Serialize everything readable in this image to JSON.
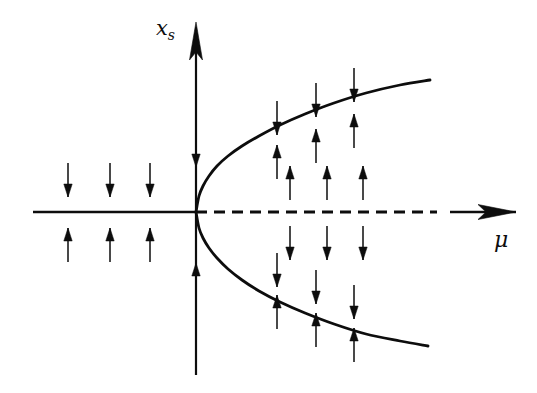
{
  "figure": {
    "kind": "pitchfork-bifurcation-diagram",
    "background_color": "#ffffff",
    "ink_color": "#0d0d0d",
    "width": 537,
    "height": 393,
    "vertical_axis_label": "x",
    "vertical_axis_label_subscript": "s",
    "horizontal_axis_label": "μ"
  },
  "chart_data": {
    "type": "line",
    "title": "",
    "xlabel": "μ",
    "ylabel": "x_s",
    "grid": false,
    "legend": "none",
    "xlim": [
      -1,
      1
    ],
    "ylim": [
      -1,
      1
    ],
    "origin_px": {
      "x": 196,
      "y": 212
    },
    "axes": {
      "horizontal": {
        "name": "mu-axis",
        "x_start_px": 33,
        "x_end_px": 516,
        "y_px": 212,
        "arrow_at": "right",
        "segments": [
          {
            "from_px": 33,
            "to_px": 196,
            "style": "solid",
            "meaning": "stable-branch-mu-negative"
          },
          {
            "from_px": 196,
            "to_px": 437,
            "style": "dashed",
            "meaning": "unstable-branch-mu-positive"
          },
          {
            "from_px": 450,
            "to_px": 516,
            "style": "solid",
            "meaning": "axis-arrow-tail"
          }
        ]
      },
      "vertical": {
        "name": "xs-axis",
        "x_px": 196,
        "y_start_px": 375,
        "y_end_px": 22,
        "arrow_at": "top"
      }
    },
    "branches": [
      {
        "name": "upper-stable-branch",
        "style": "solid",
        "points_px": [
          [
            196,
            212
          ],
          [
            199,
            196
          ],
          [
            203,
            186
          ],
          [
            209,
            176
          ],
          [
            217,
            166
          ],
          [
            228,
            156
          ],
          [
            242,
            146
          ],
          [
            259,
            136
          ],
          [
            280,
            125
          ],
          [
            305,
            114
          ],
          [
            334,
            103
          ],
          [
            366,
            93
          ],
          [
            400,
            85
          ],
          [
            430,
            80
          ]
        ]
      },
      {
        "name": "lower-stable-branch",
        "style": "solid",
        "points_px": [
          [
            196,
            212
          ],
          [
            199,
            228
          ],
          [
            203,
            238
          ],
          [
            209,
            248
          ],
          [
            217,
            258
          ],
          [
            228,
            269
          ],
          [
            242,
            280
          ],
          [
            259,
            291
          ],
          [
            280,
            302
          ],
          [
            305,
            313
          ],
          [
            334,
            324
          ],
          [
            366,
            334
          ],
          [
            400,
            341
          ],
          [
            428,
            346
          ]
        ]
      },
      {
        "name": "unstable-branch-dashed",
        "style": "dashed",
        "points_px": [
          [
            196,
            212
          ],
          [
            437,
            212
          ]
        ]
      },
      {
        "name": "stable-branch-left",
        "style": "solid",
        "points_px": [
          [
            33,
            212
          ],
          [
            196,
            212
          ]
        ]
      }
    ],
    "flow_arrows": [
      {
        "group": "left-above-axis",
        "x_px": 68,
        "y_px": 180,
        "direction": "down"
      },
      {
        "group": "left-above-axis",
        "x_px": 110,
        "y_px": 180,
        "direction": "down"
      },
      {
        "group": "left-above-axis",
        "x_px": 150,
        "y_px": 180,
        "direction": "down"
      },
      {
        "group": "left-below-axis",
        "x_px": 68,
        "y_px": 245,
        "direction": "up"
      },
      {
        "group": "left-below-axis",
        "x_px": 110,
        "y_px": 245,
        "direction": "up"
      },
      {
        "group": "left-below-axis",
        "x_px": 150,
        "y_px": 245,
        "direction": "up"
      },
      {
        "group": "axis-vertical",
        "x_px": 196,
        "y_px": 150,
        "direction": "down"
      },
      {
        "group": "axis-vertical",
        "x_px": 196,
        "y_px": 280,
        "direction": "up"
      },
      {
        "group": "right-above-dashed",
        "x_px": 290,
        "y_px": 183,
        "direction": "up"
      },
      {
        "group": "right-above-dashed",
        "x_px": 327,
        "y_px": 183,
        "direction": "up"
      },
      {
        "group": "right-above-dashed",
        "x_px": 363,
        "y_px": 183,
        "direction": "up"
      },
      {
        "group": "right-below-dashed",
        "x_px": 290,
        "y_px": 243,
        "direction": "down"
      },
      {
        "group": "right-below-dashed",
        "x_px": 327,
        "y_px": 243,
        "direction": "down"
      },
      {
        "group": "right-below-dashed",
        "x_px": 363,
        "y_px": 243,
        "direction": "down"
      },
      {
        "group": "above-upper-branch",
        "x_px": 277,
        "y_px": 118,
        "direction": "down"
      },
      {
        "group": "above-upper-branch",
        "x_px": 316,
        "y_px": 100,
        "direction": "down"
      },
      {
        "group": "above-upper-branch",
        "x_px": 354,
        "y_px": 85,
        "direction": "down"
      },
      {
        "group": "below-upper-branch",
        "x_px": 277,
        "y_px": 162,
        "direction": "up"
      },
      {
        "group": "below-upper-branch",
        "x_px": 316,
        "y_px": 146,
        "direction": "up"
      },
      {
        "group": "below-upper-branch",
        "x_px": 354,
        "y_px": 131,
        "direction": "up"
      },
      {
        "group": "above-lower-branch",
        "x_px": 277,
        "y_px": 270,
        "direction": "down"
      },
      {
        "group": "above-lower-branch",
        "x_px": 316,
        "y_px": 287,
        "direction": "down"
      },
      {
        "group": "above-lower-branch",
        "x_px": 354,
        "y_px": 302,
        "direction": "down"
      },
      {
        "group": "below-lower-branch",
        "x_px": 277,
        "y_px": 312,
        "direction": "up"
      },
      {
        "group": "below-lower-branch",
        "x_px": 316,
        "y_px": 330,
        "direction": "up"
      },
      {
        "group": "below-lower-branch",
        "x_px": 354,
        "y_px": 345,
        "direction": "up"
      }
    ]
  }
}
